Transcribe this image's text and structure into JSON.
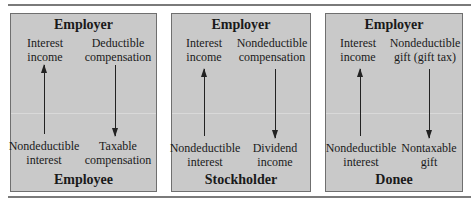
{
  "panels": [
    {
      "top_party": "Employer",
      "bottom_party": "Employee",
      "top_left": [
        "Interest",
        "income"
      ],
      "top_right": [
        "Deductible",
        "compensation"
      ],
      "bottom_left": [
        "Nondeductible",
        "interest"
      ],
      "bottom_right": [
        "Taxable",
        "compensation"
      ]
    },
    {
      "top_party": "Employer",
      "bottom_party": "Stockholder",
      "top_left": [
        "Interest",
        "income"
      ],
      "top_right": [
        "Nondeductible",
        "compensation"
      ],
      "bottom_left": [
        "Nondeductible",
        "interest"
      ],
      "bottom_right": [
        "Dividend",
        "income"
      ]
    },
    {
      "top_party": "Employer",
      "bottom_party": "Donee",
      "top_left": [
        "Interest",
        "income"
      ],
      "top_right": [
        "Nondeductible",
        "gift (gift tax)"
      ],
      "bottom_left": [
        "Nondeductible",
        "interest"
      ],
      "bottom_right": [
        "Nontaxable",
        "gift"
      ]
    }
  ],
  "colors": {
    "panel_bg": "#c9c9c9",
    "panel_border": "#6f6f6f",
    "rule": "#7a7a7a",
    "arrow": "#222222"
  }
}
